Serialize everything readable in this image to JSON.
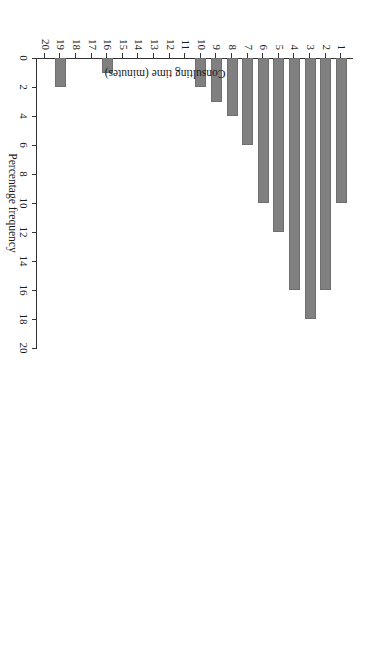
{
  "chart_data": {
    "type": "bar",
    "orientation": "horizontal-rotated",
    "title": "",
    "xlabel": "Consulting time (minutes)",
    "ylabel": "Percentage frequency",
    "categories": [
      "1",
      "2",
      "3",
      "4",
      "5",
      "6",
      "7",
      "8",
      "9",
      "10",
      "11",
      "12",
      "13",
      "14",
      "15",
      "16",
      "17",
      "18",
      "19",
      "20"
    ],
    "values": [
      10,
      16,
      18,
      16,
      12,
      10,
      6,
      4,
      3,
      2,
      0,
      0,
      0,
      0,
      0,
      1,
      0,
      0,
      2,
      0
    ],
    "ylim": [
      0,
      20
    ],
    "ytick_labels": [
      "0",
      "2",
      "4",
      "6",
      "8",
      "10",
      "12",
      "14",
      "16",
      "18",
      "20"
    ],
    "ytick_values": [
      0,
      2,
      4,
      6,
      8,
      10,
      12,
      14,
      16,
      18,
      20
    ],
    "grid": false,
    "legend": false,
    "bar_color": "#808080",
    "axis_color": "#333333",
    "background": "#ffffff"
  },
  "axes": {
    "value_axis_title": "Percentage frequency",
    "category_axis_title": "Consulting time (minutes)"
  }
}
